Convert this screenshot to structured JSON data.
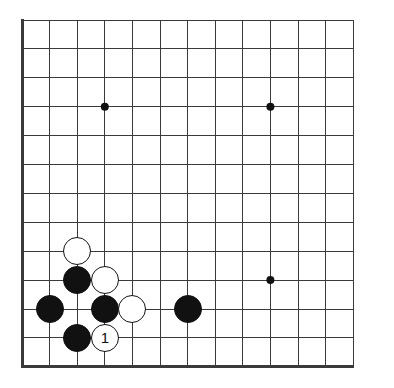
{
  "diagram": {
    "board": {
      "type": "go-board-partial",
      "cols": 13,
      "rows": 13,
      "origin_x": 22,
      "origin_y": 20,
      "spacing_x": 27.6,
      "spacing_y": 28.9,
      "line_color": "#3a3a3a",
      "thin_line_width": 1,
      "edge_line_width": 3,
      "background_color": "#ffffff",
      "edges": {
        "left": true,
        "bottom": true,
        "top": false,
        "right": false
      }
    },
    "star_points": [
      {
        "col": 3,
        "row": 3
      },
      {
        "col": 9,
        "row": 3
      },
      {
        "col": 9,
        "row": 9
      }
    ],
    "star_point_radius": 4,
    "stone_radius": 14,
    "stones": [
      {
        "id": "w-c2-r8",
        "color": "white",
        "col": 2,
        "row": 8,
        "label": ""
      },
      {
        "id": "b-c2-r9",
        "color": "black",
        "col": 2,
        "row": 9,
        "label": ""
      },
      {
        "id": "w-c3-r9",
        "color": "white",
        "col": 3,
        "row": 9,
        "label": ""
      },
      {
        "id": "b-c1-r10",
        "color": "black",
        "col": 1,
        "row": 10,
        "label": ""
      },
      {
        "id": "b-c3-r10",
        "color": "black",
        "col": 3,
        "row": 10,
        "label": ""
      },
      {
        "id": "w-c4-r10",
        "color": "white",
        "col": 4,
        "row": 10,
        "label": ""
      },
      {
        "id": "b-c6-r10",
        "color": "black",
        "col": 6,
        "row": 10,
        "label": ""
      },
      {
        "id": "b-c2-r11",
        "color": "black",
        "col": 2,
        "row": 11,
        "label": ""
      },
      {
        "id": "w-c3-r11",
        "color": "white",
        "col": 3,
        "row": 11,
        "label": "1"
      }
    ],
    "move_numbers": [
      {
        "number": "1",
        "color": "white",
        "col": 3,
        "row": 11
      }
    ]
  }
}
